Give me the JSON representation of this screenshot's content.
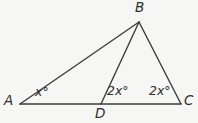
{
  "figure": {
    "vertex_labels": {
      "A": "A",
      "B": "B",
      "C": "C",
      "D": "D"
    },
    "angle_labels": {
      "at_A": "x°",
      "at_D": "2x°",
      "at_C": "2x°"
    },
    "colors": {
      "stroke": "#3d3d3d",
      "background": "#f6f6f4"
    },
    "points": {
      "A": {
        "x": 20,
        "y": 104
      },
      "B": {
        "x": 139,
        "y": 22
      },
      "C": {
        "x": 181,
        "y": 104
      },
      "D": {
        "x": 101,
        "y": 104
      }
    },
    "segments": [
      {
        "from": "A",
        "to": "B"
      },
      {
        "from": "A",
        "to": "C"
      },
      {
        "from": "B",
        "to": "D"
      },
      {
        "from": "B",
        "to": "C"
      }
    ],
    "stroke_width": 1.4
  }
}
